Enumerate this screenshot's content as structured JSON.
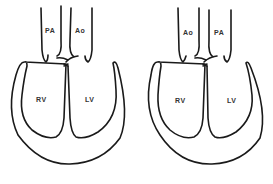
{
  "diagrams": [
    {
      "id": "normal",
      "labels": {
        "great_artery_left": "PA",
        "great_artery_right": "Ao",
        "ventricle_left": "RV",
        "ventricle_right": "LV"
      }
    },
    {
      "id": "transposed",
      "labels": {
        "great_artery_left": "Ao",
        "great_artery_right": "PA",
        "ventricle_left": "RV",
        "ventricle_right": "LV"
      }
    }
  ],
  "colors": {
    "line": "#1a1a1a",
    "label": "#333333",
    "background": "#ffffff"
  }
}
